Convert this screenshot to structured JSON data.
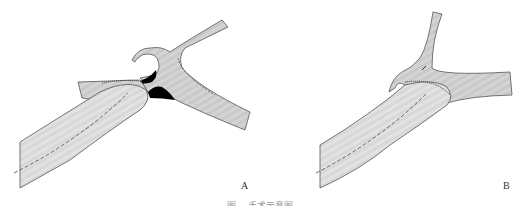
{
  "figure": {
    "panels": [
      {
        "label": "A",
        "description": "anastomosis with black gap regions between proximal vessel and bifurcation"
      },
      {
        "label": "B",
        "description": "completed anastomosis of vessel to bifurcation"
      }
    ],
    "caption": "图 　手术示意图",
    "colors": {
      "vessel_fill": "#c8c8c8",
      "vessel_light": "#d9d9d9",
      "outline": "#555555",
      "gap_fill": "#000000"
    }
  }
}
